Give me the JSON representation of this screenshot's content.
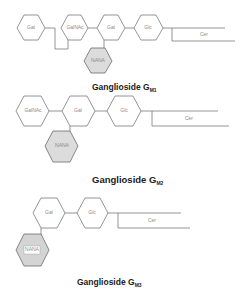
{
  "diagrams": [
    {
      "caption": {
        "main": "Ganglioside G",
        "sub": "M1"
      },
      "units": [
        "Gal",
        "GalNAc",
        "Gal",
        "Glc",
        "Cer",
        "NANA"
      ]
    },
    {
      "caption": {
        "main": "Ganglioside G",
        "sub": "M2"
      },
      "units": [
        "GalNAc",
        "Gal",
        "Glc",
        "Cer",
        "NANA"
      ]
    },
    {
      "caption": {
        "main": "Ganglioside G",
        "sub": "M3"
      },
      "units": [
        "Gal",
        "Glc",
        "Cer",
        "NANA"
      ]
    }
  ],
  "colors": {
    "nana_fill": "#dcdcdc",
    "outline": "#7a7a7a",
    "caption": "#222222"
  }
}
